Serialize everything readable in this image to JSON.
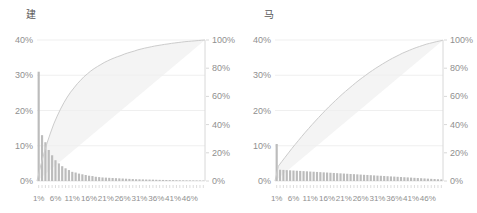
{
  "colors": {
    "background": "#ffffff",
    "bar": "#bcbcbc",
    "curve": "#cccccc",
    "shaded_area": "#f4f4f4",
    "gridline": "#efefef",
    "axis_line": "#d8d8d8",
    "bin_tick": "#cfcfcf",
    "tick_text": "#8f8f8f",
    "title_text": "#595959"
  },
  "chart_data": [
    {
      "type": "bar+line",
      "title": "建",
      "description": "Histogram of share per 1% bin with cumulative percentage curve; area between cumulative curve and equality diagonal is shaded",
      "x_bins": 50,
      "x_tick_labels": [
        "1%",
        "6%",
        "11%",
        "16%",
        "21%",
        "26%",
        "31%",
        "36%",
        "41%",
        "46%"
      ],
      "y_left_tick_labels": [
        "0%",
        "10%",
        "20%",
        "30%",
        "40%"
      ],
      "y_right_tick_labels": [
        "0%",
        "20%",
        "40%",
        "60%",
        "80%",
        "100%"
      ],
      "ylim_left": [
        0,
        40
      ],
      "ylim_right": [
        0,
        100
      ],
      "legend": "none",
      "grid": "faint horizontal",
      "bars_pct": [
        31,
        13,
        11,
        8.8,
        7.3,
        5.9,
        5,
        4.2,
        3.6,
        3.1,
        2.6,
        2.4,
        2.1,
        1.9,
        1.7,
        1.5,
        1.4,
        1.2,
        1.1,
        1,
        0.95,
        0.9,
        0.85,
        0.8,
        0.75,
        0.7,
        0.65,
        0.6,
        0.55,
        0.5,
        0.48,
        0.45,
        0.42,
        0.4,
        0.38,
        0.35,
        0.32,
        0.3,
        0.28,
        0.26,
        0.24,
        0.22,
        0.2,
        0.19,
        0.18,
        0.17,
        0.16,
        0.15,
        0.14,
        0.13
      ],
      "cumulative_pct": [
        10,
        19,
        27,
        34,
        40.5,
        46,
        51,
        55.5,
        59.5,
        63,
        66,
        69,
        71.5,
        74,
        76,
        78,
        79.7,
        81.2,
        82.6,
        84,
        85.2,
        86.3,
        87.3,
        88.2,
        89,
        90,
        90.8,
        91.5,
        92.2,
        93,
        93.6,
        94.2,
        94.7,
        95.2,
        95.7,
        96.1,
        96.5,
        96.9,
        97.2,
        97.6,
        97.9,
        98.2,
        98.5,
        98.8,
        99,
        99.2,
        99.4,
        99.6,
        99.8,
        100
      ]
    },
    {
      "type": "bar+line",
      "title": "马",
      "description": "Histogram of share per 1% bin with cumulative percentage curve; area between cumulative curve and equality diagonal is shaded",
      "x_bins": 50,
      "x_tick_labels": [
        "1%",
        "6%",
        "11%",
        "16%",
        "21%",
        "26%",
        "31%",
        "36%",
        "41%",
        "46%"
      ],
      "y_left_tick_labels": [
        "0%",
        "10%",
        "20%",
        "30%",
        "40%"
      ],
      "y_right_tick_labels": [
        "0%",
        "20%",
        "40%",
        "60%",
        "80%",
        "100%"
      ],
      "ylim_left": [
        0,
        40
      ],
      "ylim_right": [
        0,
        100
      ],
      "legend": "none",
      "grid": "faint horizontal",
      "bars_pct": [
        10.5,
        3.2,
        3.14,
        3.09,
        3.03,
        2.97,
        2.91,
        2.86,
        2.8,
        2.74,
        2.68,
        2.63,
        2.57,
        2.51,
        2.45,
        2.4,
        2.34,
        2.28,
        2.22,
        2.17,
        2.11,
        2.05,
        1.99,
        1.94,
        1.88,
        1.82,
        1.76,
        1.71,
        1.65,
        1.59,
        1.53,
        1.48,
        1.42,
        1.36,
        1.3,
        1.25,
        1.19,
        1.13,
        1.07,
        1.02,
        0.96,
        0.9,
        0.84,
        0.79,
        0.73,
        0.67,
        0.61,
        0.56,
        0.5,
        0.45
      ],
      "cumulative_pct": [
        10.5,
        13.7,
        16.8,
        19.9,
        23,
        25.9,
        28.8,
        31.7,
        34.5,
        37.2,
        39.9,
        42.5,
        45.1,
        47.6,
        50.1,
        52.5,
        54.8,
        57.1,
        59.3,
        61.5,
        63.6,
        65.6,
        67.6,
        69.6,
        71.5,
        73.3,
        75,
        76.8,
        78.4,
        80,
        81.5,
        83,
        84.4,
        85.8,
        87.1,
        88.3,
        89.5,
        90.7,
        91.7,
        92.7,
        93.7,
        94.6,
        95.4,
        96.2,
        97,
        97.6,
        98.2,
        98.8,
        99.3,
        99.8
      ]
    }
  ]
}
